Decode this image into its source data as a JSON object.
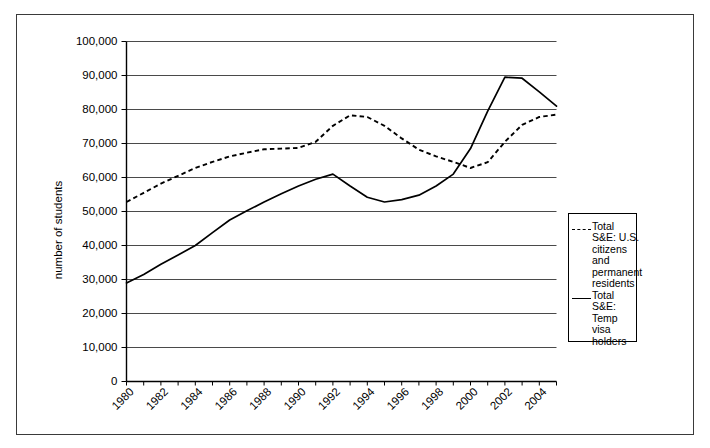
{
  "chart_data": {
    "type": "line",
    "title": "",
    "xlabel": "",
    "ylabel": "number of students",
    "xlim": [
      1980,
      2005
    ],
    "ylim": [
      0,
      100000
    ],
    "grid": true,
    "legend_position": "right-outside",
    "x": [
      1980,
      1981,
      1982,
      1983,
      1984,
      1985,
      1986,
      1987,
      1988,
      1989,
      1990,
      1991,
      1992,
      1993,
      1994,
      1995,
      1996,
      1997,
      1998,
      1999,
      2000,
      2001,
      2002,
      2003,
      2004,
      2005
    ],
    "ytick_labels": [
      "0",
      "10,000",
      "20,000",
      "30,000",
      "40,000",
      "50,000",
      "60,000",
      "70,000",
      "80,000",
      "90,000",
      "100,000"
    ],
    "ytick_values": [
      0,
      10000,
      20000,
      30000,
      40000,
      50000,
      60000,
      70000,
      80000,
      90000,
      100000
    ],
    "xtick_labels": [
      "1980",
      "1982",
      "1984",
      "1986",
      "1988",
      "1990",
      "1992",
      "1994",
      "1996",
      "1998",
      "2000",
      "2002",
      "2004"
    ],
    "xtick_values": [
      1980,
      1982,
      1984,
      1986,
      1988,
      1990,
      1992,
      1994,
      1996,
      1998,
      2000,
      2002,
      2004
    ],
    "series": [
      {
        "name": "Total S&E: U.S. citizens and permanent residents",
        "style": "dashed",
        "legend_label": "Total\nS&E: U.S.\ncitizens\nand\npermanent\nresidents",
        "values": [
          52800,
          55500,
          58200,
          60500,
          62800,
          64600,
          66200,
          67300,
          68300,
          68500,
          68700,
          70500,
          75200,
          78300,
          77800,
          75200,
          71500,
          68200,
          66200,
          64600,
          62800,
          64500,
          70500,
          75500,
          77800,
          78500
        ]
      },
      {
        "name": "Total S&E: Temp visa holders",
        "style": "solid",
        "legend_label": "Total\nS&E:\nTemp visa\nholders",
        "values": [
          29000,
          31500,
          34500,
          37200,
          40000,
          43800,
          47500,
          50200,
          52800,
          55200,
          57500,
          59500,
          61000,
          57500,
          54200,
          52800,
          53500,
          54800,
          57500,
          61000,
          68500,
          79500,
          89500,
          89200,
          85200,
          81000
        ]
      }
    ]
  },
  "legend": {
    "entries": [
      {
        "label": "Total\nS&E: U.S.\ncitizens\nand\npermanent\nresidents",
        "style": "dashed"
      },
      {
        "label": "Total\nS&E:\nTemp visa\nholders",
        "style": "solid"
      }
    ]
  },
  "axes": {
    "y_title": "number of students"
  }
}
